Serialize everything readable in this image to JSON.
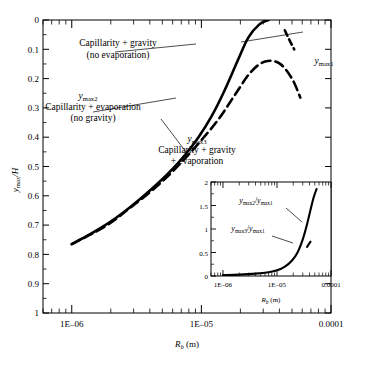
{
  "chart_data": {
    "type": "line",
    "title": "",
    "xlabel": "R_b (m)",
    "ylabel": "y_max/H",
    "xscale": "log",
    "xlim": [
      6e-07,
      0.0001
    ],
    "ylim": [
      0,
      1
    ],
    "grid": false,
    "legend": "annotations",
    "xticklabels": [
      "1E–06",
      "1E–05",
      "0.0001"
    ],
    "xtickvalues": [
      1e-06,
      1e-05,
      0.0001
    ],
    "yticklabels": [
      "0",
      "0.1",
      "0.2",
      "0.3",
      "0.4",
      "0.5",
      "0.6",
      "0.7",
      "0.8",
      "0.9",
      "1"
    ],
    "ytickvalues": [
      0,
      0.1,
      0.2,
      0.3,
      0.4,
      0.5,
      0.6,
      0.7,
      0.8,
      0.9,
      1
    ],
    "series": [
      {
        "name": "y_max1",
        "label": "Capillarity + gravity (no evaporation)",
        "style": "solid",
        "color": "#000000",
        "x": [
          1e-06,
          1.3e-06,
          1.7e-06,
          2.2e-06,
          2.8e-06,
          3.6e-06,
          4.6e-06,
          6e-06,
          7.5e-06,
          9.5e-06,
          1.2e-05,
          1.5e-05,
          1.9e-05,
          2.3e-05,
          2.8e-05,
          3.3e-05
        ],
        "y": [
          0.235,
          0.262,
          0.292,
          0.325,
          0.36,
          0.4,
          0.442,
          0.492,
          0.54,
          0.6,
          0.672,
          0.757,
          0.86,
          0.94,
          0.985,
          1.0
        ]
      },
      {
        "name": "y_max2",
        "label": "Capillarity + evaporation (no gravity)",
        "style": "dashed",
        "color": "#000000",
        "x": [
          1e-06,
          1.4e-06,
          2e-06,
          2.8e-06,
          4e-06,
          5.6e-06,
          7.5e-06,
          1e-05,
          1.35e-05,
          1.8e-05,
          2.4e-05,
          3.1e-05,
          4e-05,
          5e-05,
          5.8e-05
        ],
        "y": [
          0.235,
          0.268,
          0.308,
          0.358,
          0.412,
          0.47,
          0.528,
          0.59,
          0.66,
          0.742,
          0.822,
          0.858,
          0.852,
          0.8,
          0.735
        ]
      },
      {
        "name": "y_max3",
        "label": "Capillarity + gravity + evaporation",
        "style": "dashed-short",
        "color": "#000000",
        "x": [
          4.4e-05,
          4.8e-05,
          5.2e-05
        ],
        "y": [
          0.965,
          0.93,
          0.9
        ]
      }
    ],
    "annotations": [
      {
        "name": "annotation-ymax1",
        "text_lines": [
          "Capillarity + gravity",
          "(no evaporation)"
        ],
        "leader": true
      },
      {
        "name": "annotation-ymax2",
        "symbol": "y_max2",
        "text_lines": [
          "Capillarity + evaporation",
          "(no gravity)"
        ],
        "leader": true
      },
      {
        "name": "annotation-ymax3",
        "symbol": "y_max3",
        "text_lines": [
          "Capillarity + gravity",
          "+ evaporation"
        ],
        "leader": true
      },
      {
        "name": "label-ymax1",
        "symbol": "y_max1",
        "leader": false
      }
    ],
    "inset": {
      "type": "line",
      "xlabel": "R_b (m)",
      "ylabel": "",
      "xscale": "log",
      "xlim": [
        6e-07,
        0.0001
      ],
      "ylim": [
        0,
        2
      ],
      "xticklabels": [
        "1E–06",
        "1E–05",
        "0.0001"
      ],
      "yticklabels": [
        "0",
        "0.5",
        "1",
        "1.5",
        "2"
      ],
      "ytickvalues": [
        0,
        0.5,
        1,
        1.5,
        2
      ],
      "series": [
        {
          "name": "y_max2/y_max1",
          "label": "y_max2/y_max1",
          "style": "solid",
          "x": [
            1e-06,
            2e-06,
            4e-06,
            7e-06,
            1e-05,
            1.4e-05,
            1.9e-05,
            2.4e-05,
            3e-05,
            3.6e-05,
            4.2e-05,
            4.8e-05,
            5.4e-05
          ],
          "y": [
            0.02,
            0.03,
            0.05,
            0.08,
            0.12,
            0.2,
            0.33,
            0.5,
            0.78,
            1.1,
            1.42,
            1.68,
            1.85
          ]
        },
        {
          "name": "y_max3/y_max1",
          "label": "y_max3/y_max1",
          "style": "dashed-short",
          "x": [
            3.6e-05,
            4e-05,
            4.4e-05
          ],
          "y": [
            0.62,
            0.7,
            0.76
          ]
        }
      ]
    }
  },
  "axis": {
    "y_label_main": "y",
    "y_label_sub": "max",
    "y_label_tail": "/H",
    "x_label_main": "R",
    "x_label_sub": "b",
    "x_label_tail": " (m)"
  },
  "labels": {
    "ymax1": "y",
    "ymax1_sub": "max1",
    "ymax2": "y",
    "ymax2_sub": "max2",
    "ymax3": "y",
    "ymax3_sub": "max3",
    "cap_grav_l1": "Capillarity + gravity",
    "cap_grav_l2": "(no evaporation)",
    "cap_evap_l1": "Capillarity + evaporation",
    "cap_evap_l2": "(no gravity)",
    "cap_ge_l1": "Capillarity + gravity",
    "cap_ge_l2": "+ evaporation",
    "ratio21_num": "y",
    "ratio21_num_sub": "max2",
    "ratio21_slash": "/",
    "ratio21_den": "y",
    "ratio21_den_sub": "max1",
    "ratio31_num": "y",
    "ratio31_num_sub": "max3",
    "ratio31_slash": "/",
    "ratio31_den": "y",
    "ratio31_den_sub": "max1"
  },
  "ticks": {
    "y": [
      "1",
      "0.9",
      "0.8",
      "0.7",
      "0.6",
      "0.5",
      "0.4",
      "0.3",
      "0.2",
      "0.1",
      "0"
    ],
    "x": [
      "1E–06",
      "1E–05",
      "0.0001"
    ],
    "inset_y": [
      "2",
      "1.5",
      "1",
      "0.5",
      "0"
    ],
    "inset_x": [
      "1E–06",
      "1E–05",
      "0.0001"
    ]
  },
  "colors": {
    "ink": "#000000",
    "background": "#ffffff"
  }
}
